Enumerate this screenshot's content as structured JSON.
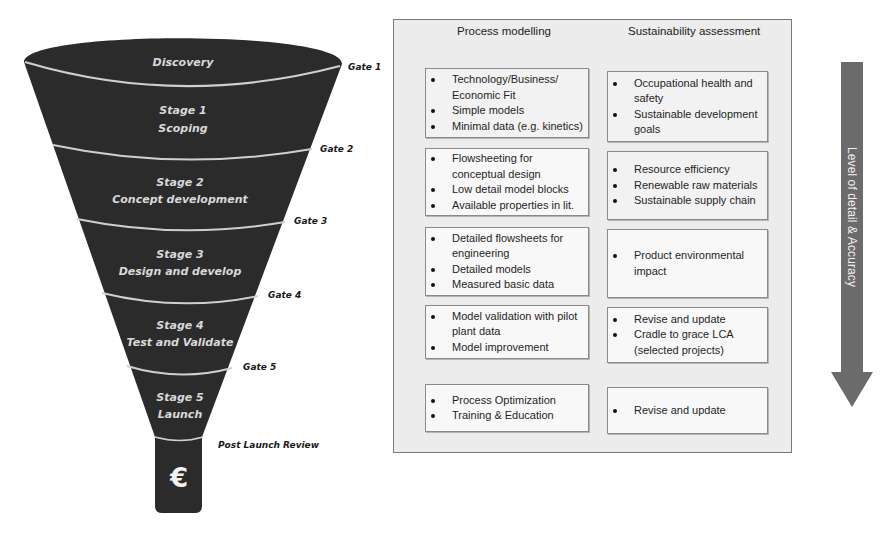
{
  "funnel": {
    "stages": [
      {
        "line1": "Discovery",
        "line2": ""
      },
      {
        "line1": "Stage 1",
        "line2": "Scoping"
      },
      {
        "line1": "Stage 2",
        "line2": "Concept development"
      },
      {
        "line1": "Stage 3",
        "line2": "Design and develop"
      },
      {
        "line1": "Stage 4",
        "line2": "Test and Validate"
      },
      {
        "line1": "Stage 5",
        "line2": "Launch"
      }
    ],
    "gates": [
      "Gate 1",
      "Gate 2",
      "Gate 3",
      "Gate 4",
      "Gate 5",
      "Post Launch Review"
    ],
    "spout_symbol": "€",
    "fill_color": "#2b2b2b",
    "separator_color": "#cfcfcf"
  },
  "panel": {
    "headers": {
      "process": "Process modelling",
      "sustainability": "Sustainability assessment"
    },
    "rows": [
      {
        "process": [
          "Technology/Business/ Economic Fit",
          "Simple models",
          "Minimal data (e.g. kinetics)"
        ],
        "sustainability": [
          "Occupational health and safety",
          "Sustainable development goals"
        ]
      },
      {
        "process": [
          "Flowsheeting for conceptual design",
          "Low detail model blocks",
          "Available properties in lit."
        ],
        "sustainability": [
          "Resource efficiency",
          "Renewable raw materials",
          "Sustainable supply chain"
        ]
      },
      {
        "process": [
          "Detailed flowsheets for engineering",
          "Detailed  models",
          "Measured basic data"
        ],
        "sustainability": [
          "Product environmental impact"
        ]
      },
      {
        "process": [
          "Model validation with pilot plant data",
          "Model improvement"
        ],
        "sustainability": [
          "Revise and update",
          "Cradle to grace LCA (selected projects)"
        ]
      },
      {
        "process": [
          "Process Optimization",
          "Training & Education"
        ],
        "sustainability": [
          "Revise and update"
        ]
      }
    ]
  },
  "arrow": {
    "label": "Level of detail & Accuracy",
    "color": "#6b6b6b"
  }
}
